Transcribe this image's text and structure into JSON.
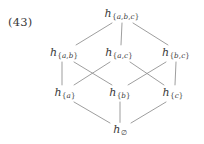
{
  "figure": {
    "equation_number": "(43)",
    "type": "hasse-diagram",
    "line_color": "#8c8c8c",
    "text_color": "#3a3a3a",
    "background_color": "#ffffff"
  },
  "nodes": [
    {
      "id": "top",
      "base": "h",
      "subscript": "{a,b,c}",
      "label": "h_{a,b,c}",
      "x": 122,
      "y": 14,
      "rank": 3
    },
    {
      "id": "ab",
      "base": "h",
      "subscript": "{a,b}",
      "label": "h_{a,b}",
      "x": 64,
      "y": 53,
      "rank": 2
    },
    {
      "id": "ac",
      "base": "h",
      "subscript": "{a,c}",
      "label": "h_{a,c}",
      "x": 119,
      "y": 53,
      "rank": 2
    },
    {
      "id": "bc",
      "base": "h",
      "subscript": "{b,c}",
      "label": "h_{b,c}",
      "x": 176,
      "y": 53,
      "rank": 2
    },
    {
      "id": "a",
      "base": "h",
      "subscript": "{a}",
      "label": "h_{a}",
      "x": 65,
      "y": 93,
      "rank": 1
    },
    {
      "id": "b",
      "base": "h",
      "subscript": "{b}",
      "label": "h_{b}",
      "x": 120,
      "y": 93,
      "rank": 1
    },
    {
      "id": "c",
      "base": "h",
      "subscript": "{c}",
      "label": "h_{c}",
      "x": 173,
      "y": 93,
      "rank": 1
    },
    {
      "id": "empty",
      "base": "h",
      "subscript": "∅",
      "label": "h_∅",
      "x": 120,
      "y": 130,
      "rank": 0
    }
  ],
  "edges": [
    {
      "from": "top",
      "to": "ab",
      "x1": 112,
      "y1": 23,
      "x2": 76,
      "y2": 45
    },
    {
      "from": "top",
      "to": "ac",
      "x1": 122,
      "y1": 23,
      "x2": 121,
      "y2": 45
    },
    {
      "from": "top",
      "to": "bc",
      "x1": 133,
      "y1": 23,
      "x2": 168,
      "y2": 45
    },
    {
      "from": "ab",
      "to": "a",
      "x1": 62,
      "y1": 62,
      "x2": 62,
      "y2": 85
    },
    {
      "from": "ab",
      "to": "b",
      "x1": 74,
      "y1": 62,
      "x2": 112,
      "y2": 85
    },
    {
      "from": "ac",
      "to": "a",
      "x1": 110,
      "y1": 62,
      "x2": 74,
      "y2": 85
    },
    {
      "from": "ac",
      "to": "c",
      "x1": 130,
      "y1": 62,
      "x2": 164,
      "y2": 85
    },
    {
      "from": "bc",
      "to": "b",
      "x1": 166,
      "y1": 62,
      "x2": 128,
      "y2": 85
    },
    {
      "from": "bc",
      "to": "c",
      "x1": 176,
      "y1": 62,
      "x2": 175,
      "y2": 85
    },
    {
      "from": "a",
      "to": "empty",
      "x1": 74,
      "y1": 102,
      "x2": 110,
      "y2": 123
    },
    {
      "from": "b",
      "to": "empty",
      "x1": 120,
      "y1": 102,
      "x2": 120,
      "y2": 123
    },
    {
      "from": "c",
      "to": "empty",
      "x1": 166,
      "y1": 102,
      "x2": 131,
      "y2": 123
    }
  ],
  "equation_label": {
    "text": "(43)",
    "x": 8,
    "y": 15
  }
}
